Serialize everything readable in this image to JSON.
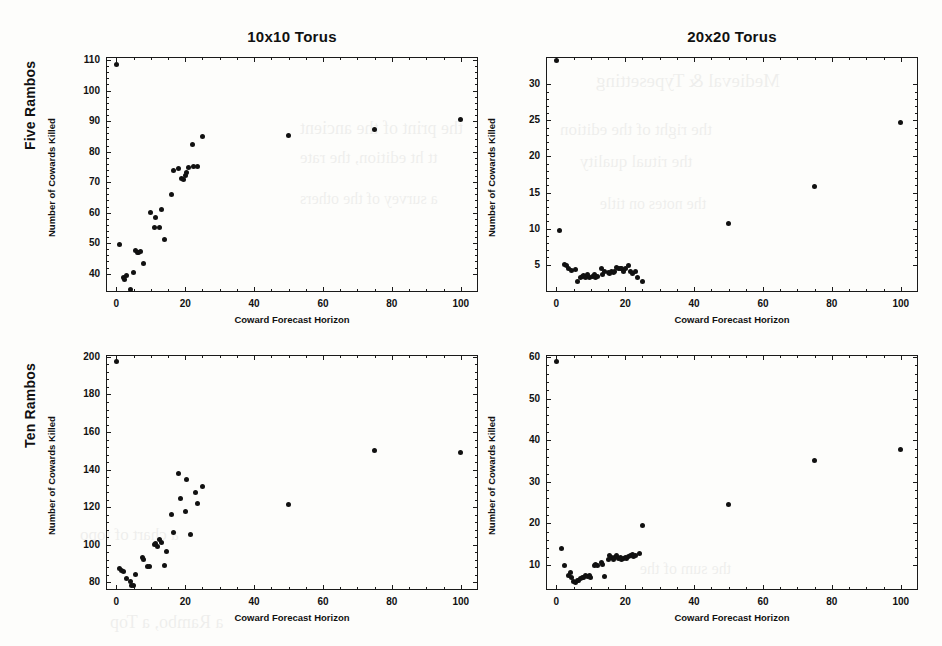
{
  "figure": {
    "background_color": "#fdfdfb",
    "marker_color": "#111111",
    "axis_color": "#1a1a1a"
  },
  "row_labels": [
    {
      "name": "five-rambos",
      "label": "Five Rambos"
    },
    {
      "name": "ten-rambos",
      "label": "Ten Rambos"
    }
  ],
  "column_titles": [
    {
      "name": "torus-10x10",
      "label": "10x10 Torus"
    },
    {
      "name": "torus-20x20",
      "label": "20x20 Torus"
    }
  ],
  "bleed_text": [
    {
      "text": "Medieval & Typesetting",
      "x": 596,
      "y": 70,
      "size": 19
    },
    {
      "text": "the print of the ancient",
      "x": 300,
      "y": 118,
      "size": 18
    },
    {
      "text": "the right  of the edition",
      "x": 560,
      "y": 120,
      "size": 17
    },
    {
      "text": "tt  ht  edition,  the  rate",
      "x": 300,
      "y": 148,
      "size": 17
    },
    {
      "text": "the  ritual  quality",
      "x": 580,
      "y": 152,
      "size": 17
    },
    {
      "text": "a  survey of the others",
      "x": 300,
      "y": 190,
      "size": 16
    },
    {
      "text": "the  notes  on  title",
      "x": 600,
      "y": 195,
      "size": 16
    },
    {
      "text": "a  chart  of  topo",
      "x": 80,
      "y": 525,
      "size": 17
    },
    {
      "text": "a  Rambo,  a  Top",
      "x": 110,
      "y": 612,
      "size": 18
    },
    {
      "text": "the  sum of  the",
      "x": 640,
      "y": 560,
      "size": 16
    }
  ],
  "chart_data": [
    {
      "name": "five-rambos-10x10-torus",
      "type": "scatter",
      "title": "10x10 Torus",
      "row": "Five Rambos",
      "xlabel": "Coward Forecast  Horizon",
      "ylabel": "Number of Cowards Killed",
      "xlim": [
        -3,
        105
      ],
      "ylim": [
        34,
        111
      ],
      "xticks": [
        0,
        20,
        40,
        60,
        80,
        100
      ],
      "yticks": [
        40,
        50,
        60,
        70,
        80,
        90,
        100,
        110
      ],
      "grid": false,
      "legend": "none",
      "points": [
        [
          0,
          108.7
        ],
        [
          1,
          49.7
        ],
        [
          2,
          38.6
        ],
        [
          2.5,
          38.0
        ],
        [
          3,
          39.4
        ],
        [
          4,
          34.8
        ],
        [
          5,
          40.3
        ],
        [
          5.5,
          47.6
        ],
        [
          6,
          47.0
        ],
        [
          6.5,
          47.1
        ],
        [
          7,
          47.3
        ],
        [
          8,
          43.3
        ],
        [
          10,
          60.1
        ],
        [
          11,
          55.2
        ],
        [
          11.5,
          58.3
        ],
        [
          12.5,
          55.0
        ],
        [
          13,
          61.0
        ],
        [
          14,
          51.2
        ],
        [
          16,
          66.0
        ],
        [
          16.5,
          73.8
        ],
        [
          18,
          74.5
        ],
        [
          19,
          71.2
        ],
        [
          19.5,
          70.9
        ],
        [
          20,
          72.3
        ],
        [
          20.5,
          73.1
        ],
        [
          21,
          74.8
        ],
        [
          22,
          82.2
        ],
        [
          22.5,
          75.1
        ],
        [
          23.5,
          75.2
        ],
        [
          25,
          84.8
        ],
        [
          50,
          85.4
        ],
        [
          75,
          87.4
        ],
        [
          100,
          90.5
        ]
      ]
    },
    {
      "name": "five-rambos-20x20-torus",
      "type": "scatter",
      "title": "20x20 Torus",
      "row": "Five Rambos",
      "xlabel": "Coward Forecast  Horizon",
      "ylabel": "Number of Cowards Killed",
      "xlim": [
        -3,
        105
      ],
      "ylim": [
        1.2,
        33.8
      ],
      "xticks": [
        0,
        20,
        40,
        60,
        80,
        100
      ],
      "yticks": [
        5,
        10,
        15,
        20,
        25,
        30
      ],
      "grid": false,
      "legend": "none",
      "points": [
        [
          0,
          33.3
        ],
        [
          1,
          9.8
        ],
        [
          2.5,
          5.0
        ],
        [
          3,
          4.9
        ],
        [
          3.5,
          4.4
        ],
        [
          4.5,
          4.2
        ],
        [
          5.5,
          4.3
        ],
        [
          6,
          2.6
        ],
        [
          7,
          3.2
        ],
        [
          7.5,
          3.3
        ],
        [
          8,
          3.5
        ],
        [
          8.5,
          3.2
        ],
        [
          9,
          3.6
        ],
        [
          9.5,
          3.2
        ],
        [
          10.5,
          3.4
        ],
        [
          11,
          3.6
        ],
        [
          11.5,
          3.2
        ],
        [
          12,
          3.3
        ],
        [
          13,
          4.5
        ],
        [
          13.5,
          3.6
        ],
        [
          14,
          4.0
        ],
        [
          15,
          3.9
        ],
        [
          15.5,
          3.8
        ],
        [
          16,
          4.0
        ],
        [
          16.5,
          3.9
        ],
        [
          17,
          4.1
        ],
        [
          17.5,
          4.6
        ],
        [
          18,
          4.5
        ],
        [
          18.5,
          4.4
        ],
        [
          19,
          4.4
        ],
        [
          19.5,
          4.0
        ],
        [
          20,
          4.4
        ],
        [
          21,
          4.9
        ],
        [
          21.5,
          4.1
        ],
        [
          22,
          3.8
        ],
        [
          23,
          4.0
        ],
        [
          23.5,
          3.2
        ],
        [
          25,
          2.7
        ],
        [
          50,
          10.7
        ],
        [
          75,
          15.9
        ],
        [
          100,
          24.7
        ]
      ]
    },
    {
      "name": "ten-rambos-10x10-torus",
      "type": "scatter",
      "title": "10x10 Torus",
      "row": "Ten Rambos",
      "xlabel": "Coward Forecast  Horizon",
      "ylabel": "Number of Cowards Killed",
      "xlim": [
        -3,
        105
      ],
      "ylim": [
        76,
        201
      ],
      "xticks": [
        0,
        20,
        40,
        60,
        80,
        100
      ],
      "yticks": [
        80,
        100,
        120,
        140,
        160,
        180,
        200
      ],
      "grid": false,
      "legend": "none",
      "points": [
        [
          0,
          197.5
        ],
        [
          1,
          87.4
        ],
        [
          1.5,
          86.6
        ],
        [
          2,
          86.0
        ],
        [
          3,
          82.2
        ],
        [
          4,
          80.3
        ],
        [
          4.5,
          78.4
        ],
        [
          5,
          78.2
        ],
        [
          5.5,
          84.0
        ],
        [
          7.5,
          93.2
        ],
        [
          8,
          92.3
        ],
        [
          9,
          88.7
        ],
        [
          9.5,
          88.3
        ],
        [
          11,
          100.2
        ],
        [
          11.5,
          100.5
        ],
        [
          12,
          99.4
        ],
        [
          12.5,
          103.0
        ],
        [
          13,
          101.4
        ],
        [
          14,
          88.9
        ],
        [
          14.5,
          96.5
        ],
        [
          16,
          116.2
        ],
        [
          16.5,
          106.6
        ],
        [
          18,
          138.0
        ],
        [
          18.5,
          124.5
        ],
        [
          20,
          117.5
        ],
        [
          20.5,
          134.8
        ],
        [
          21.5,
          105.3
        ],
        [
          23,
          127.6
        ],
        [
          23.5,
          121.8
        ],
        [
          25,
          131.3
        ],
        [
          50,
          121.7
        ],
        [
          75,
          150.2
        ],
        [
          100,
          149.3
        ]
      ]
    },
    {
      "name": "ten-rambos-20x20-torus",
      "type": "scatter",
      "title": "20x20 Torus",
      "row": "Ten Rambos",
      "xlabel": "Coward Forecast  Horizon",
      "ylabel": "Number of Cowards Killed",
      "xlim": [
        -3,
        105
      ],
      "ylim": [
        4.0,
        60.5
      ],
      "xticks": [
        0,
        20,
        40,
        60,
        80,
        100
      ],
      "yticks": [
        10,
        20,
        30,
        40,
        50,
        60
      ],
      "grid": false,
      "legend": "none",
      "points": [
        [
          0,
          59.0
        ],
        [
          1.5,
          14.0
        ],
        [
          2.5,
          9.8
        ],
        [
          3.5,
          7.6
        ],
        [
          4,
          8.3
        ],
        [
          4.5,
          7.1
        ],
        [
          5,
          6.1
        ],
        [
          5.5,
          5.9
        ],
        [
          6,
          6.2
        ],
        [
          6.5,
          6.4
        ],
        [
          7,
          6.7
        ],
        [
          7.5,
          7.0
        ],
        [
          8,
          7.1
        ],
        [
          8.5,
          7.4
        ],
        [
          9,
          7.2
        ],
        [
          9.5,
          7.6
        ],
        [
          10,
          7.0
        ],
        [
          11,
          10.0
        ],
        [
          11.5,
          10.2
        ],
        [
          12,
          9.9
        ],
        [
          13,
          10.5
        ],
        [
          13.5,
          10.1
        ],
        [
          14,
          7.2
        ],
        [
          15,
          11.3
        ],
        [
          15.5,
          12.3
        ],
        [
          16,
          11.9
        ],
        [
          16.5,
          11.4
        ],
        [
          17,
          11.7
        ],
        [
          17.5,
          12.2
        ],
        [
          18,
          11.6
        ],
        [
          18.5,
          11.8
        ],
        [
          19,
          11.3
        ],
        [
          19.5,
          11.6
        ],
        [
          20,
          11.9
        ],
        [
          20.5,
          11.5
        ],
        [
          21,
          12.0
        ],
        [
          21.5,
          12.4
        ],
        [
          22,
          12.6
        ],
        [
          22.5,
          12.0
        ],
        [
          23,
          12.4
        ],
        [
          24,
          12.7
        ],
        [
          25,
          19.4
        ],
        [
          50,
          24.5
        ],
        [
          75,
          35.1
        ],
        [
          100,
          37.7
        ]
      ]
    }
  ]
}
